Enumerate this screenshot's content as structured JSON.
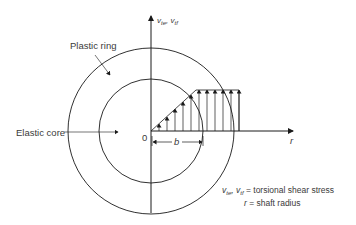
{
  "labels": {
    "plastic_ring": "Plastic ring",
    "elastic_core": "Elastic core",
    "origin": "0",
    "b": "b",
    "r_axis": "r",
    "v_axis": {
      "v1": "v",
      "s1": "te",
      "sep": ", ",
      "v2": "v",
      "s2": "tf"
    }
  },
  "legend": {
    "line1": {
      "v1": "v",
      "s1": "te",
      "sep": ", ",
      "v2": "v",
      "s2": "tf",
      "text": " = torsional shear stress"
    },
    "line2": {
      "sym": "r",
      "text": " = shaft radius"
    }
  },
  "colors": {
    "stroke": "#1a1a1a",
    "text": "#3a3a3a",
    "background": "#ffffff"
  },
  "geometry": {
    "origin": [
      151,
      131
    ],
    "inner_radius": 52,
    "outer_radius": 83,
    "yield_point": [
      196,
      90
    ],
    "plateau_end_x": 239
  }
}
